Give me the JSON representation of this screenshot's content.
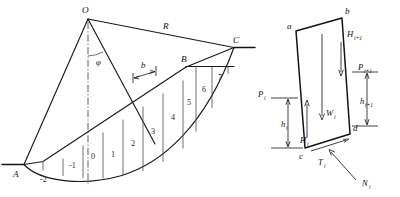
{
  "figure": {
    "colors": {
      "line": "#1a1a1a",
      "thin_line": "#555555",
      "background": "#ffffff",
      "text": "#111111"
    },
    "left_diagram": {
      "name": "circular-slip-surface-slices",
      "points": [
        {
          "id": "O",
          "label": "O",
          "x": 88,
          "y": 17
        },
        {
          "id": "A",
          "label": "A",
          "x": 17,
          "y": 166
        },
        {
          "id": "B",
          "label": "B",
          "x": 186,
          "y": 66
        },
        {
          "id": "C",
          "label": "C",
          "x": 234,
          "y": 47
        }
      ],
      "radius_label": "R",
      "angle_label": "φ",
      "width_label": "b",
      "slice_numbers": [
        "-2",
        "-1",
        "0",
        "1",
        "2",
        "3",
        "4",
        "5",
        "6",
        "7"
      ]
    },
    "right_diagram": {
      "name": "single-slice-free-body",
      "vertices": [
        {
          "id": "a",
          "label": "a"
        },
        {
          "id": "b",
          "label": "b"
        },
        {
          "id": "c",
          "label": "c"
        },
        {
          "id": "d",
          "label": "d"
        }
      ],
      "forces": [
        {
          "id": "Pi",
          "symbol": "P",
          "subscript": "i"
        },
        {
          "id": "Hi",
          "symbol": "H",
          "subscript": "i"
        },
        {
          "id": "hi",
          "symbol": "h",
          "subscript": "i"
        },
        {
          "id": "Pi1",
          "symbol": "P",
          "subscript": "i+1"
        },
        {
          "id": "Hi1",
          "symbol": "H",
          "subscript": "i+1"
        },
        {
          "id": "hi1",
          "symbol": "h",
          "subscript": "i+1"
        },
        {
          "id": "Wi",
          "symbol": "W",
          "subscript": "i"
        },
        {
          "id": "Ti",
          "symbol": "T",
          "subscript": "i"
        },
        {
          "id": "Ni",
          "symbol": "N",
          "subscript": "i"
        }
      ]
    }
  }
}
